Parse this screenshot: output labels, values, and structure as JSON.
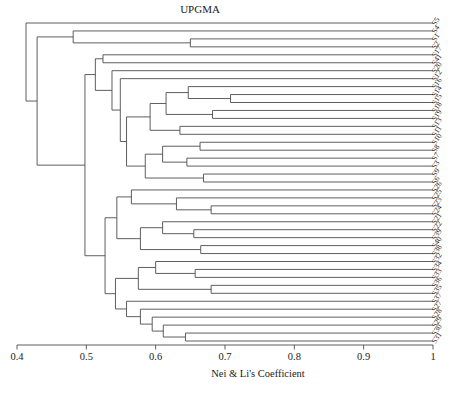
{
  "title": "UPGMA",
  "colors": {
    "line": "#4d4d4d",
    "text": "#1a1a1a",
    "background": "#ffffff"
  },
  "chart_data": {
    "type": "dendrogram",
    "method": "UPGMA",
    "title": "UPGMA",
    "xlabel": "Nei & Li's Coefficient",
    "axis": {
      "min": 0.4,
      "max": 1.0,
      "tick_values": [
        0.4,
        0.5,
        0.6,
        0.7,
        0.8,
        0.9,
        1.0
      ],
      "tick_labels": [
        "0.4",
        "0.5",
        "0.6",
        "0.7",
        "0.8",
        "0.9",
        "1"
      ]
    },
    "leaf_order": [
      "S5",
      "S4",
      "S1",
      "S2",
      "S17",
      "S41",
      "S20",
      "S12",
      "S16",
      "S14",
      "S15",
      "S18",
      "S19",
      "S13",
      "S11",
      "S10",
      "S8",
      "S7",
      "S3",
      "S9",
      "S6",
      "S26",
      "S25",
      "S23",
      "S24",
      "S21",
      "S22",
      "S39",
      "S40",
      "S38",
      "S32",
      "S34",
      "S33",
      "S36",
      "S35",
      "S37",
      "S27",
      "S28",
      "S29",
      "S30",
      "S31"
    ],
    "tree": {
      "c": 0.413,
      "children": [
        {
          "leaf": "S5"
        },
        {
          "c": 0.429,
          "children": [
            {
              "c": 0.481,
              "children": [
                {
                  "leaf": "S4"
                },
                {
                  "c": 0.65,
                  "children": [
                    {
                      "leaf": "S1"
                    },
                    {
                      "leaf": "S2"
                    }
                  ]
                }
              ]
            },
            {
              "c": 0.498,
              "children": [
                {
                  "c": 0.513,
                  "children": [
                    {
                      "c": 0.524,
                      "children": [
                        {
                          "leaf": "S17"
                        },
                        {
                          "leaf": "S41"
                        }
                      ]
                    },
                    {
                      "c": 0.537,
                      "children": [
                        {
                          "leaf": "S20"
                        },
                        {
                          "c": 0.549,
                          "children": [
                            {
                              "leaf": "S12"
                            },
                            {
                              "c": 0.558,
                              "children": [
                                {
                                  "c": 0.592,
                                  "children": [
                                    {
                                      "c": 0.615,
                                      "children": [
                                        {
                                          "c": 0.647,
                                          "children": [
                                            {
                                              "leaf": "S16"
                                            },
                                            {
                                              "c": 0.708,
                                              "children": [
                                                {
                                                  "leaf": "S14"
                                                },
                                                {
                                                  "leaf": "S15"
                                                }
                                              ]
                                            }
                                          ]
                                        },
                                        {
                                          "c": 0.682,
                                          "children": [
                                            {
                                              "leaf": "S18"
                                            },
                                            {
                                              "leaf": "S19"
                                            }
                                          ]
                                        }
                                      ]
                                    },
                                    {
                                      "c": 0.635,
                                      "children": [
                                        {
                                          "leaf": "S13"
                                        },
                                        {
                                          "leaf": "S11"
                                        }
                                      ]
                                    }
                                  ]
                                },
                                {
                                  "c": 0.585,
                                  "children": [
                                    {
                                      "c": 0.61,
                                      "children": [
                                        {
                                          "c": 0.664,
                                          "children": [
                                            {
                                              "leaf": "S10"
                                            },
                                            {
                                              "leaf": "S8"
                                            }
                                          ]
                                        },
                                        {
                                          "c": 0.645,
                                          "children": [
                                            {
                                              "leaf": "S7"
                                            },
                                            {
                                              "leaf": "S3"
                                            }
                                          ]
                                        }
                                      ]
                                    },
                                    {
                                      "c": 0.669,
                                      "children": [
                                        {
                                          "leaf": "S9"
                                        },
                                        {
                                          "leaf": "S6"
                                        }
                                      ]
                                    }
                                  ]
                                }
                              ]
                            }
                          ]
                        }
                      ]
                    }
                  ]
                },
                {
                  "c": 0.527,
                  "children": [
                    {
                      "c": 0.544,
                      "children": [
                        {
                          "c": 0.565,
                          "children": [
                            {
                              "leaf": "S26"
                            },
                            {
                              "c": 0.63,
                              "children": [
                                {
                                  "leaf": "S25"
                                },
                                {
                                  "c": 0.68,
                                  "children": [
                                    {
                                      "leaf": "S23"
                                    },
                                    {
                                      "leaf": "S24"
                                    }
                                  ]
                                }
                              ]
                            }
                          ]
                        },
                        {
                          "c": 0.578,
                          "children": [
                            {
                              "c": 0.61,
                              "children": [
                                {
                                  "leaf": "S21"
                                },
                                {
                                  "c": 0.655,
                                  "children": [
                                    {
                                      "leaf": "S22"
                                    },
                                    {
                                      "leaf": "S39"
                                    }
                                  ]
                                }
                              ]
                            },
                            {
                              "c": 0.665,
                              "children": [
                                {
                                  "leaf": "S40"
                                },
                                {
                                  "leaf": "S38"
                                }
                              ]
                            }
                          ]
                        }
                      ]
                    },
                    {
                      "c": 0.542,
                      "children": [
                        {
                          "c": 0.575,
                          "children": [
                            {
                              "c": 0.6,
                              "children": [
                                {
                                  "leaf": "S32"
                                },
                                {
                                  "c": 0.657,
                                  "children": [
                                    {
                                      "leaf": "S34"
                                    },
                                    {
                                      "leaf": "S33"
                                    }
                                  ]
                                }
                              ]
                            },
                            {
                              "c": 0.68,
                              "children": [
                                {
                                  "leaf": "S36"
                                },
                                {
                                  "leaf": "S35"
                                }
                              ]
                            }
                          ]
                        },
                        {
                          "c": 0.558,
                          "children": [
                            {
                              "leaf": "S37"
                            },
                            {
                              "c": 0.578,
                              "children": [
                                {
                                  "leaf": "S27"
                                },
                                {
                                  "c": 0.595,
                                  "children": [
                                    {
                                      "leaf": "S28"
                                    },
                                    {
                                      "c": 0.611,
                                      "children": [
                                        {
                                          "leaf": "S29"
                                        },
                                        {
                                          "c": 0.643,
                                          "children": [
                                            {
                                              "leaf": "S30"
                                            },
                                            {
                                              "leaf": "S31"
                                            }
                                          ]
                                        }
                                      ]
                                    }
                                  ]
                                }
                              ]
                            }
                          ]
                        }
                      ]
                    }
                  ]
                }
              ]
            }
          ]
        }
      ]
    }
  },
  "layout_values": {
    "x_left_px": 17,
    "x_right_px": 433,
    "first_leaf_y": 23,
    "last_leaf_y": 341,
    "axis_y": 345
  }
}
